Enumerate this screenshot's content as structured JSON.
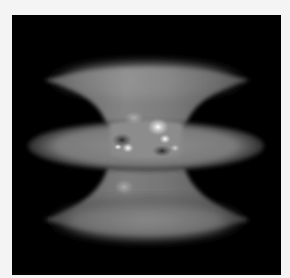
{
  "figure": {
    "background_color": "#000000",
    "surface_color": "#9a9a9a",
    "frame_color": "#f4f4f4"
  }
}
